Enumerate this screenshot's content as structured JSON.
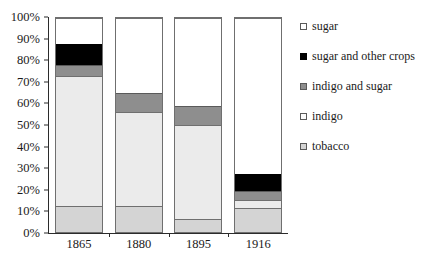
{
  "chart_data": {
    "type": "bar",
    "subtype": "stacked-percent",
    "title": "",
    "xlabel": "",
    "ylabel": "",
    "ylim": [
      0,
      100
    ],
    "grid": false,
    "legend_position": "right",
    "categories": [
      "1865",
      "1880",
      "1895",
      "1916"
    ],
    "ytick_labels": [
      "0%",
      "10%",
      "20%",
      "30%",
      "40%",
      "50%",
      "60%",
      "70%",
      "80%",
      "90%",
      "100%"
    ],
    "ytick_values": [
      0,
      10,
      20,
      30,
      40,
      50,
      60,
      70,
      80,
      90,
      100
    ],
    "series": [
      {
        "name": "tobacco",
        "color": "#d4d4d4",
        "values": [
          12,
          12,
          6,
          11
        ]
      },
      {
        "name": "indigo",
        "color": "#ebebeb",
        "values": [
          61,
          44,
          44,
          4
        ]
      },
      {
        "name": "indigo and sugar",
        "color": "#8e8e8e",
        "values": [
          5,
          9,
          9,
          4
        ]
      },
      {
        "name": "sugar and other crops",
        "color": "#000000",
        "values": [
          10,
          0,
          0,
          8
        ]
      },
      {
        "name": "sugar",
        "color": "#ffffff",
        "values": [
          12,
          35,
          41,
          73
        ]
      }
    ],
    "stack_order_bottom_to_top": [
      "tobacco",
      "indigo",
      "indigo and sugar",
      "sugar and other crops",
      "sugar"
    ],
    "cumulative_tops": {
      "1865": {
        "tobacco": 12,
        "indigo": 73,
        "indigo and sugar": 78,
        "sugar and other crops": 88,
        "sugar": 100
      },
      "1880": {
        "tobacco": 12,
        "indigo": 56,
        "indigo and sugar": 65,
        "sugar and other crops": 65,
        "sugar": 100
      },
      "1895": {
        "tobacco": 6,
        "indigo": 50,
        "indigo and sugar": 59,
        "sugar and other crops": 59,
        "sugar": 100
      },
      "1916": {
        "tobacco": 11,
        "indigo": 15,
        "indigo and sugar": 19,
        "sugar and other crops": 27,
        "sugar": 100
      }
    }
  },
  "legend": {
    "items": [
      {
        "label": "sugar",
        "swatch": "swatch-sugar-icon"
      },
      {
        "label": "sugar and other crops",
        "swatch": "swatch-sugar-and-other-crops-icon"
      },
      {
        "label": "indigo and sugar",
        "swatch": "swatch-indigo-and-sugar-icon"
      },
      {
        "label": "indigo",
        "swatch": "swatch-indigo-icon"
      },
      {
        "label": "tobacco",
        "swatch": "swatch-tobacco-icon"
      }
    ]
  },
  "top_partial_text": ""
}
